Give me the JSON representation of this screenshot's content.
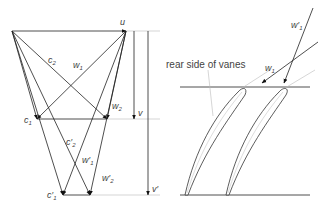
{
  "figure": {
    "velocity_triangles": {
      "labels": {
        "u": "u",
        "c2": "c",
        "c2_sub": "2",
        "w1": "w",
        "w1_sub": "1",
        "w2": "w",
        "w2_sub": "2",
        "c1": "c",
        "c1_sub": "1",
        "v": "v",
        "c2_prime": "c′",
        "c2_prime_sub": "2",
        "w1_prime": "w′",
        "w1_prime_sub": "1",
        "w2_prime": "w′",
        "w2_prime_sub": "2",
        "c1_prime": "c′",
        "c1_prime_sub": "1",
        "v_prime": "v′"
      }
    },
    "cascade": {
      "annotation": "rear side of vanes",
      "labels": {
        "w1_prime": "w′",
        "w1_prime_sub": "1",
        "w1": "w",
        "w1_sub": "1"
      }
    },
    "colors": {
      "line": "#222222",
      "guide": "#bbbbbb",
      "text": "#444444"
    }
  }
}
